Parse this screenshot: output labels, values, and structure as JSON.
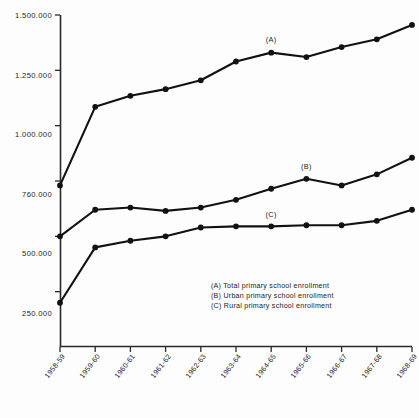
{
  "chart_data": {
    "type": "line",
    "title": "",
    "subtitle": "",
    "xlabel": "",
    "ylabel": "",
    "grid": false,
    "legend_position": "inside-lower-right",
    "categories": [
      "1958-59",
      "1959-60",
      "1960-61",
      "1961-62",
      "1962-63",
      "1963-64",
      "1964-65",
      "1965-66",
      "1966-67",
      "1967-68",
      "1968-69"
    ],
    "ylim": [
      0,
      1500000
    ],
    "yticks": [
      250000,
      500000,
      750000,
      1000000,
      1250000,
      1500000
    ],
    "ytick_labels": [
      "250.000",
      "500.000",
      "760.000",
      "1.000.000",
      "1.250.000",
      "1.500.000"
    ],
    "series": [
      {
        "name": "Total primary school enrollment",
        "key": "A",
        "color": "#111111",
        "marker": "filled-circle",
        "values": [
          730000,
          1085000,
          1135000,
          1165000,
          1205000,
          1290000,
          1330000,
          1310000,
          1355000,
          1390000,
          1455000
        ]
      },
      {
        "name": "Urban primary school enrollment",
        "key": "B",
        "color": "#111111",
        "marker": "filled-circle",
        "values": [
          500000,
          620000,
          630000,
          615000,
          630000,
          665000,
          715000,
          760000,
          730000,
          780000,
          855000
        ]
      },
      {
        "name": "Rural primary school enrollment",
        "key": "C",
        "color": "#111111",
        "marker": "filled-circle",
        "values": [
          200000,
          450000,
          480000,
          500000,
          540000,
          545000,
          545000,
          550000,
          550000,
          570000,
          620000
        ]
      }
    ],
    "annotations": [
      {
        "text": "(A)",
        "series": "A",
        "x_index": 6
      },
      {
        "text": "(B)",
        "series": "B",
        "x_index": 7
      },
      {
        "text": "(C)",
        "series": "C",
        "x_index": 6
      }
    ]
  },
  "yaxis": {
    "tick_1": "1.500.000",
    "tick_2": "1.250.000",
    "tick_3": "1.000.000",
    "tick_4": "760.000",
    "tick_5": "500.000",
    "tick_6": "250.000"
  },
  "xaxis": {
    "tick_1": "1958-59",
    "tick_2": "1959-60",
    "tick_3": "1960-61",
    "tick_4": "1961-62",
    "tick_5": "1962-63",
    "tick_6": "1963-64",
    "tick_7": "1964-65",
    "tick_8": "1965-66",
    "tick_9": "1966-67",
    "tick_10": "1967-68",
    "tick_11": "1968-69"
  },
  "series_tags": {
    "a": "(A)",
    "b": "(B)",
    "c": "(C)"
  },
  "legend": {
    "line_a": "(A) Total primary school enrollment",
    "line_b": "(B) Urban primary school enrollment",
    "line_c": "(C) Rural primary school enrollment"
  }
}
